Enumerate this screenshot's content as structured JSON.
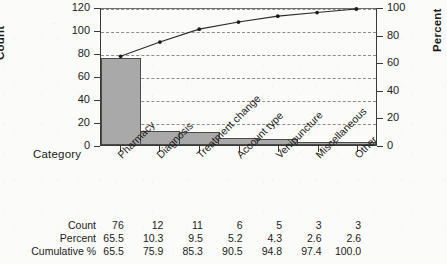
{
  "chart_data": {
    "type": "bar",
    "title": "",
    "subtitle": "",
    "xlabel": "Category",
    "ylabel": "Count",
    "y2label": "Percent",
    "categories": [
      "Pharmacy",
      "Diagnosis",
      "Treatment change",
      "Account type",
      "Venipuncture",
      "Miscellaneous",
      "Other"
    ],
    "series": [
      {
        "name": "Count",
        "type": "bar",
        "values": [
          76,
          12,
          11,
          6,
          5,
          3,
          3
        ]
      },
      {
        "name": "Cumulative %",
        "type": "line",
        "axis": "right",
        "values": [
          65.5,
          75.9,
          85.3,
          90.5,
          94.8,
          97.4,
          100.0
        ]
      }
    ],
    "percent": [
      65.5,
      10.3,
      9.5,
      5.2,
      4.3,
      2.6,
      2.6
    ],
    "ylim": [
      0,
      120
    ],
    "yticks": [
      0,
      20,
      40,
      60,
      80,
      100,
      120
    ],
    "y2lim": [
      0,
      100
    ],
    "y2ticks": [
      0,
      20,
      40,
      60,
      80,
      100
    ],
    "grid": true,
    "grid_style": "dashed-horizontal",
    "legend": "none",
    "colors": {
      "bar_fill": "#a9a9a9",
      "bar_border": "#4a4a4a",
      "line": "#2b2b2b",
      "marker": "#1c1c1c",
      "axis": "#3a3a3a",
      "grid": "#8d8d8d",
      "background": "#fbfbf9"
    }
  },
  "axes": {
    "left_title": "Count",
    "right_title": "Percent",
    "category_title": "Category",
    "left_ticks": [
      "0",
      "20",
      "40",
      "60",
      "80",
      "100",
      "120"
    ],
    "right_ticks": [
      "0",
      "20",
      "40",
      "60",
      "80",
      "100"
    ]
  },
  "table": {
    "rows": [
      {
        "label": "Count",
        "values": [
          "76",
          "12",
          "11",
          "6",
          "5",
          "3",
          "3"
        ]
      },
      {
        "label": "Percent",
        "values": [
          "65.5",
          "10.3",
          "9.5",
          "5.2",
          "4.3",
          "2.6",
          "2.6"
        ]
      },
      {
        "label": "Cumulative %",
        "values": [
          "65.5",
          "75.9",
          "85.3",
          "90.5",
          "94.8",
          "97.4",
          "100.0"
        ]
      }
    ]
  }
}
